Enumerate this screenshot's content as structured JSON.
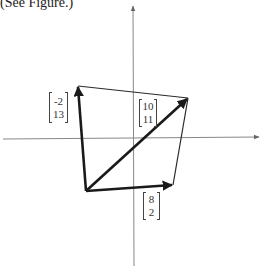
{
  "caption": "(See Figure.)",
  "labels": {
    "v1": {
      "top": "-2",
      "bottom": "13"
    },
    "v2": {
      "top": "10",
      "bottom": "11"
    },
    "v3": {
      "top": "8",
      "bottom": "2"
    }
  },
  "colors": {
    "axis": "#888888",
    "vector": "#1a1a1a",
    "edge": "#2a2a2a"
  },
  "diagram": {
    "type": "vector-parallelogram",
    "vectors": [
      {
        "name": "u",
        "components": [
          -2,
          13
        ]
      },
      {
        "name": "v",
        "components": [
          8,
          2
        ]
      },
      {
        "name": "u+v",
        "components": [
          10,
          11
        ]
      }
    ]
  }
}
